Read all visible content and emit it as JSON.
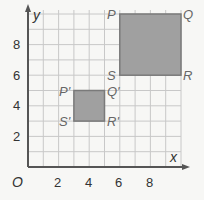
{
  "diagram": {
    "type": "coordinate-plane-dilation",
    "axes": {
      "x_label": "x",
      "y_label": "y",
      "origin_label": "O",
      "x_ticks": [
        "2",
        "4",
        "6",
        "8"
      ],
      "y_ticks": [
        "2",
        "4",
        "6",
        "8"
      ],
      "x_range": [
        0,
        10
      ],
      "y_range": [
        0,
        10
      ],
      "grid_step": 1
    },
    "shapes": [
      {
        "name": "PQRS",
        "fill": "#a0a0a0",
        "stroke": "#7a7a7a",
        "vertices": {
          "P": [
            6,
            10
          ],
          "Q": [
            10,
            10
          ],
          "R": [
            10,
            6
          ],
          "S": [
            6,
            6
          ]
        },
        "labels": {
          "P": "P",
          "Q": "Q",
          "R": "R",
          "S": "S"
        }
      },
      {
        "name": "P'Q'R'S'",
        "fill": "#a0a0a0",
        "stroke": "#7a7a7a",
        "vertices": {
          "P": [
            3,
            5
          ],
          "Q": [
            5,
            5
          ],
          "R": [
            5,
            3
          ],
          "S": [
            3,
            3
          ]
        },
        "labels": {
          "P": "P'",
          "Q": "Q'",
          "R": "R'",
          "S": "S'"
        }
      }
    ],
    "colors": {
      "grid": "#c8c8c8",
      "axis": "#555555",
      "background": "#f7f7f5",
      "shape_fill": "#a0a0a0"
    }
  }
}
